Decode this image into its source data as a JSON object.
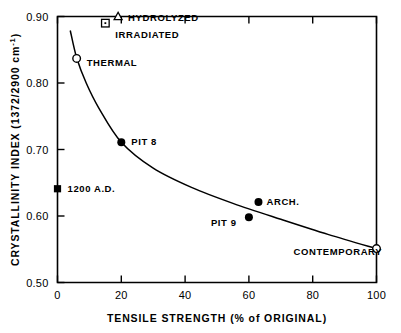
{
  "figure": {
    "background_color": "#ffffff",
    "ink_color": "#000000"
  },
  "chart_data": {
    "type": "scatter",
    "title": "",
    "subtitle": "",
    "xlabel": "TENSILE STRENGTH (% of ORIGINAL)",
    "ylabel": "CRYSTALLINITY INDEX (1372/2900 cm⁻¹)",
    "ylabel_main": "CRYSTALLINITY  INDEX (1372/2900 cm",
    "ylabel_sup": "-1",
    "ylabel_tail": ")",
    "xlim": [
      0,
      100
    ],
    "ylim": [
      0.5,
      0.9
    ],
    "grid": false,
    "legend": "none",
    "x_ticks": [
      0,
      20,
      40,
      60,
      80,
      100
    ],
    "x_tick_labels": [
      "0",
      "20",
      "40",
      "60",
      "80",
      "100"
    ],
    "y_ticks": [
      0.5,
      0.6,
      0.7,
      0.8,
      0.9
    ],
    "y_tick_labels": [
      "0.50",
      "0.60",
      "0.70",
      "0.80",
      "0.90"
    ],
    "points": [
      {
        "label": "HYDROLYZED",
        "x": 19,
        "y": 0.9,
        "marker": "open-triangle",
        "label_dx": 10,
        "label_dy": 4
      },
      {
        "label": "IRRADIATED",
        "x": 15,
        "y": 0.89,
        "marker": "open-square",
        "label_dx": 10,
        "label_dy": 15
      },
      {
        "label": "THERMAL",
        "x": 6,
        "y": 0.837,
        "marker": "open-circle",
        "label_dx": 10,
        "label_dy": 8
      },
      {
        "label": "PIT 8",
        "x": 20,
        "y": 0.711,
        "marker": "filled-circle",
        "label_dx": 10,
        "label_dy": 3
      },
      {
        "label": "1200 A.D.",
        "x": 0,
        "y": 0.641,
        "marker": "filled-square",
        "label_dx": 10,
        "label_dy": 3
      },
      {
        "label": "ARCH.",
        "x": 63,
        "y": 0.621,
        "marker": "filled-circle",
        "label_dx": 8,
        "label_dy": 3
      },
      {
        "label": "PIT 9",
        "x": 60,
        "y": 0.598,
        "marker": "filled-circle",
        "label_dx": -38,
        "label_dy": 9
      },
      {
        "label": "CONTEMPORARY",
        "x": 100,
        "y": 0.551,
        "marker": "open-circle",
        "label_dx": -83,
        "label_dy": 6
      }
    ],
    "fit_curve": {
      "name": "decay-trend-curve",
      "description": "Smooth monotonically decreasing curve through the data",
      "points": [
        {
          "x": 4.0,
          "y": 0.879
        },
        {
          "x": 6.0,
          "y": 0.838
        },
        {
          "x": 9.0,
          "y": 0.8
        },
        {
          "x": 13.0,
          "y": 0.762
        },
        {
          "x": 20.0,
          "y": 0.711
        },
        {
          "x": 30.0,
          "y": 0.672
        },
        {
          "x": 42.0,
          "y": 0.643
        },
        {
          "x": 55.0,
          "y": 0.619
        },
        {
          "x": 70.0,
          "y": 0.595
        },
        {
          "x": 85.0,
          "y": 0.572
        },
        {
          "x": 100.0,
          "y": 0.551
        }
      ]
    }
  }
}
